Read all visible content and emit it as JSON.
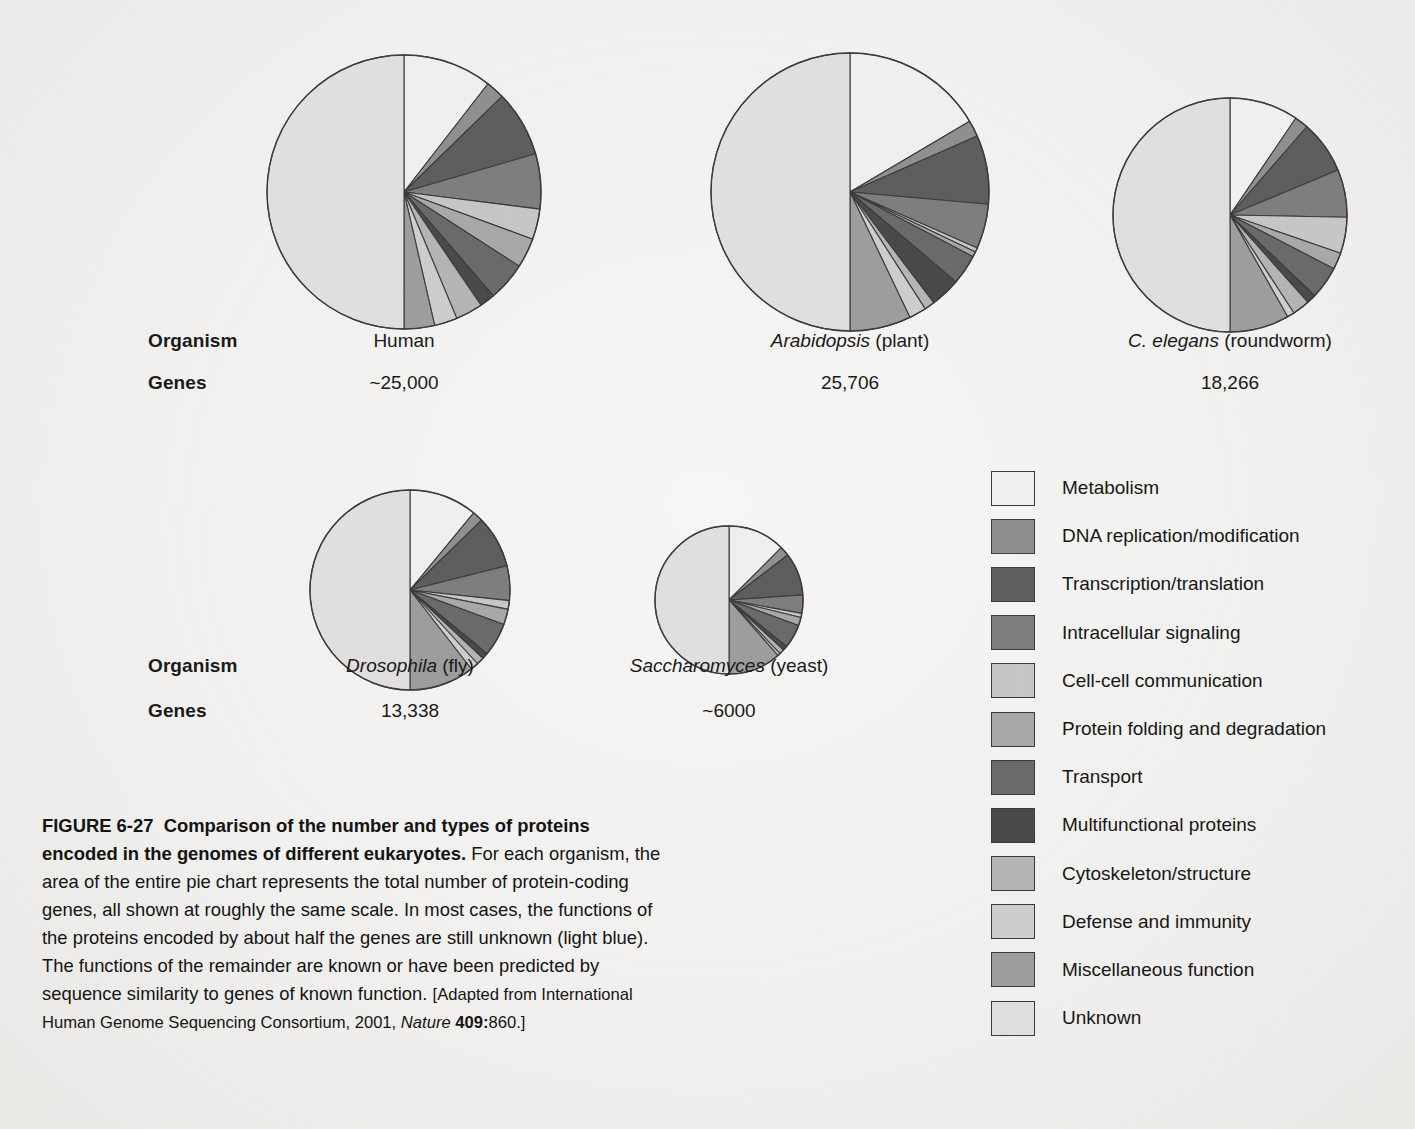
{
  "table": {
    "row_labels": [
      "Organism",
      "Genes"
    ],
    "top_row": [
      {
        "organism_plain": "Human",
        "organism_italic": "",
        "organism_suffix": "",
        "genes": "~25,000"
      },
      {
        "organism_plain": "",
        "organism_italic": "Arabidopsis",
        "organism_suffix": " (plant)",
        "genes": "25,706"
      },
      {
        "organism_plain": "",
        "organism_italic": "C. elegans",
        "organism_suffix": " (roundworm)",
        "genes": "18,266"
      }
    ],
    "bottom_row": [
      {
        "organism_plain": "",
        "organism_italic": "Drosophila",
        "organism_suffix": " (fly)",
        "genes": "13,338"
      },
      {
        "organism_plain": "",
        "organism_italic": "Saccharomyces",
        "organism_suffix": " (yeast)",
        "genes": "~6000"
      }
    ]
  },
  "legend": {
    "items": [
      {
        "label": "Metabolism",
        "color": "#f0efed"
      },
      {
        "label": "DNA replication/modification",
        "color": "#8f8f8f"
      },
      {
        "label": "Transcription/translation",
        "color": "#5e5e5e"
      },
      {
        "label": "Intracellular signaling",
        "color": "#7e7e7e"
      },
      {
        "label": "Cell-cell communication",
        "color": "#c6c6c4"
      },
      {
        "label": "Protein folding and degradation",
        "color": "#a8a8a6"
      },
      {
        "label": "Transport",
        "color": "#6a6a6a"
      },
      {
        "label": "Multifunctional proteins",
        "color": "#4a4a4a"
      },
      {
        "label": "Cytoskeleton/structure",
        "color": "#b4b4b2"
      },
      {
        "label": "Defense and immunity",
        "color": "#cdcdcb"
      },
      {
        "label": "Miscellaneous function",
        "color": "#9d9d9b"
      },
      {
        "label": "Unknown",
        "color": "#e0dfdd"
      }
    ]
  },
  "caption": {
    "figure_number": "FIGURE 6-27",
    "title": "Comparison of the number and types of proteins encoded in the genomes of different eukaryotes.",
    "body": "For each organism, the area of the entire pie chart represents the total number of protein-coding genes, all shown at roughly the same scale. In most cases, the functions of the proteins encoded by about half the genes are still unknown (light blue). The functions of the remainder are known or have been predicted by sequence similarity to genes of known function.",
    "source_open": "[Adapted from International Human Genome Sequencing Consortium, 2001, ",
    "source_italic": "Nature",
    "source_volume": "409:",
    "source_close": "860.]"
  },
  "chart_data": {
    "type": "pie",
    "title": "Comparison of the number and types of proteins encoded in the genomes of different eukaryotes",
    "categories": [
      "Metabolism",
      "DNA replication/modification",
      "Transcription/translation",
      "Intracellular signaling",
      "Cell-cell communication",
      "Protein folding and degradation",
      "Transport",
      "Multifunctional proteins",
      "Cytoskeleton/structure",
      "Defense and immunity",
      "Miscellaneous function",
      "Unknown"
    ],
    "category_colors": [
      "#f0efed",
      "#8f8f8f",
      "#5e5e5e",
      "#7e7e7e",
      "#c6c6c4",
      "#a8a8a6",
      "#6a6a6a",
      "#4a4a4a",
      "#b4b4b2",
      "#cdcdcb",
      "#9d9d9b",
      "#e0dfdd"
    ],
    "units": "percent of protein-coding genes",
    "note": "Slices start at 12 o'clock and proceed clockwise; the final 'Unknown' slice fills the left half. Pie areas are proportional to total gene counts.",
    "series": [
      {
        "name": "Human",
        "genes": "~25,000",
        "genes_value": 25000,
        "radius_px": 137,
        "values": [
          10.5,
          2.2,
          7.8,
          6.5,
          3.6,
          3.5,
          4.6,
          1.8,
          3.2,
          2.7,
          3.6,
          50.0
        ]
      },
      {
        "name": "Arabidopsis (plant)",
        "genes": "25,706",
        "genes_value": 25706,
        "radius_px": 139,
        "values": [
          16.5,
          1.9,
          8.0,
          5.2,
          0.5,
          0.6,
          3.5,
          3.5,
          1.2,
          2.0,
          7.1,
          50.0
        ]
      },
      {
        "name": "C. elegans (roundworm)",
        "genes": "18,266",
        "genes_value": 18266,
        "radius_px": 117,
        "values": [
          9.5,
          1.9,
          7.3,
          6.6,
          5.0,
          2.3,
          4.5,
          1.3,
          2.4,
          1.0,
          8.2,
          50.0
        ]
      },
      {
        "name": "Drosophila (fly)",
        "genes": "13,338",
        "genes_value": 13338,
        "radius_px": 100,
        "values": [
          11.0,
          1.7,
          8.4,
          5.6,
          1.4,
          2.5,
          5.4,
          1.0,
          1.2,
          1.3,
          10.5,
          50.0
        ]
      },
      {
        "name": "Saccharomyces (yeast)",
        "genes": "~6000",
        "genes_value": 6000,
        "radius_px": 74,
        "values": [
          12.5,
          2.1,
          9.3,
          4.0,
          0.9,
          1.8,
          5.2,
          1.0,
          1.1,
          0.6,
          11.5,
          50.0
        ]
      }
    ]
  },
  "layout": {
    "pies": [
      {
        "series": 0,
        "cx": 404,
        "cy": 192
      },
      {
        "series": 1,
        "cx": 850,
        "cy": 192
      },
      {
        "series": 2,
        "cx": 1230,
        "cy": 215
      },
      {
        "series": 3,
        "cx": 410,
        "cy": 590
      },
      {
        "series": 4,
        "cx": 729,
        "cy": 600
      }
    ],
    "top_row_label_y": [
      330,
      372
    ],
    "bottom_row_label_y": [
      655,
      700
    ],
    "row_label_x": 148,
    "top_cells_x": [
      404,
      850,
      1230
    ],
    "bottom_cells_x": [
      410,
      729
    ]
  }
}
